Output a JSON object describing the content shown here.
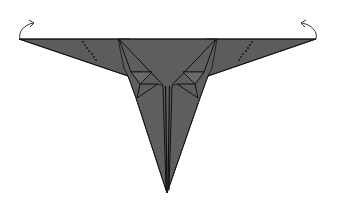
{
  "diagram": {
    "type": "origami-fold-step",
    "subject": "paper airplane",
    "colors": {
      "paper": "#5c5c5c",
      "paper_light": "#666666",
      "crease": "#111111",
      "background": "#ffffff",
      "arrow": "#333333"
    },
    "annotations": {
      "left_arrow": "fold-up-arrow",
      "right_arrow": "fold-up-arrow",
      "left_dotted": "valley-fold-line",
      "right_dotted": "valley-fold-line"
    }
  }
}
